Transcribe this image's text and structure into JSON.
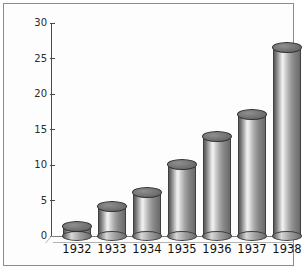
{
  "chart_data": {
    "type": "bar",
    "title": "",
    "subtitle": "",
    "xlabel": "",
    "ylabel": "Amount (billions of marks)",
    "categories": [
      "1932",
      "1933",
      "1934",
      "1935",
      "1936",
      "1937",
      "1938"
    ],
    "values": [
      1.3,
      4.1,
      6.1,
      10.0,
      14.0,
      17.0,
      26.5
    ],
    "series": [
      {
        "name": "Amount",
        "values": [
          1.3,
          4.1,
          6.1,
          10.0,
          14.0,
          17.0,
          26.5
        ]
      }
    ],
    "ylim": [
      0,
      30
    ],
    "ytick_labels": [
      "0",
      "5",
      "10",
      "15",
      "20",
      "25",
      "30"
    ],
    "ytick_values": [
      0,
      5,
      10,
      15,
      20,
      25,
      30
    ],
    "grid": false,
    "legend": "none",
    "bar_style": "3d-cylinder",
    "annotations": []
  },
  "style": {
    "frame_border": "#8c8c8c",
    "background": "#fdfdfd",
    "axis_color": "#4a4a4a",
    "text_color": "#111111",
    "bar_fill_light": "#f2f2f2",
    "bar_fill_dark": "#5c5c5c",
    "bar_top_fill": "#777777"
  }
}
